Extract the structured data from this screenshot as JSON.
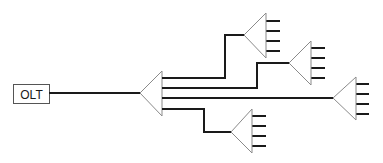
{
  "diagram": {
    "title": "",
    "olt": {
      "label": "OLT",
      "box": {
        "x": 13,
        "y": 84,
        "w": 36,
        "h": 19
      }
    },
    "colors": {
      "line": "#1a1a1a",
      "triangle": "#8a8a8a",
      "box_border": "#555555",
      "background": "#ffffff"
    },
    "central_splitter": {
      "apex": [
        140,
        93
      ],
      "base_x": 162,
      "base_top": 71,
      "base_bottom": 116
    },
    "feed_line": {
      "from": [
        49,
        93
      ],
      "to": [
        140,
        93
      ]
    },
    "branches": [
      {
        "path": [
          [
            162,
            78
          ],
          [
            225,
            78
          ],
          [
            225,
            35
          ],
          [
            244,
            35
          ]
        ],
        "splitter": {
          "apex": [
            244,
            35
          ],
          "base_x": 266,
          "base_top": 13,
          "base_bottom": 58,
          "ports_y": [
            21,
            31,
            41,
            51
          ],
          "port_len": 14
        }
      },
      {
        "path": [
          [
            162,
            88
          ],
          [
            257,
            88
          ],
          [
            257,
            63
          ],
          [
            289,
            63
          ]
        ],
        "splitter": {
          "apex": [
            289,
            63
          ],
          "base_x": 311,
          "base_top": 41,
          "base_bottom": 85,
          "ports_y": [
            48,
            58,
            68,
            78
          ],
          "port_len": 14
        }
      },
      {
        "path": [
          [
            162,
            98
          ],
          [
            333,
            98
          ]
        ],
        "splitter": {
          "apex": [
            333,
            98
          ],
          "base_x": 356,
          "base_top": 77,
          "base_bottom": 120,
          "ports_y": [
            84,
            94,
            104,
            114
          ],
          "port_len": 13
        }
      },
      {
        "path": [
          [
            162,
            109
          ],
          [
            204,
            109
          ],
          [
            204,
            132
          ],
          [
            231,
            132
          ]
        ],
        "splitter": {
          "apex": [
            231,
            132
          ],
          "base_x": 252,
          "base_top": 109,
          "base_bottom": 153,
          "ports_y": [
            116,
            126,
            136,
            146
          ],
          "port_len": 14
        }
      }
    ]
  }
}
